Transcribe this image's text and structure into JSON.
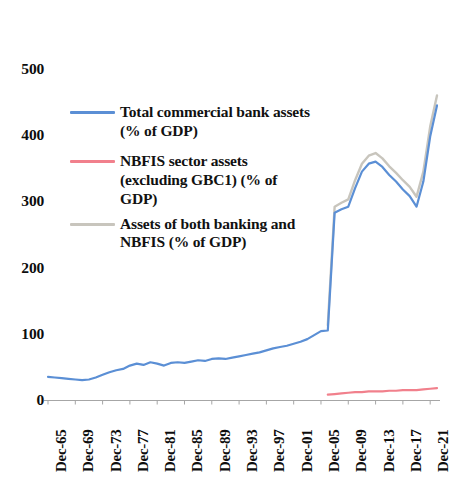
{
  "chart_data": {
    "type": "line",
    "title": "",
    "subtitle": "",
    "xlabel": "",
    "ylabel": "",
    "ylim": [
      0,
      500
    ],
    "y_ticks": [
      0,
      100,
      200,
      300,
      400,
      500
    ],
    "grid": false,
    "legend_position": "inside-upper-left",
    "x_tick_labels": [
      "Dec-65",
      "Dec-69",
      "Dec-73",
      "Dec-77",
      "Dec-81",
      "Dec-85",
      "Dec-89",
      "Dec-93",
      "Dec-97",
      "Dec-01",
      "Dec-05",
      "Dec-09",
      "Dec-13",
      "Dec-17",
      "Dec-21"
    ],
    "x_tick_years": [
      1965,
      1969,
      1973,
      1977,
      1981,
      1985,
      1989,
      1993,
      1997,
      2001,
      2005,
      2009,
      2013,
      2017,
      2021
    ],
    "x_range_years": [
      1965,
      2022
    ],
    "colors": {
      "series_bank": "#5B8FD5",
      "series_nbfis": "#F1808C",
      "series_both": "#C8C5BD",
      "axis": "#A6A6A6",
      "text": "#0d0d0d"
    },
    "series": [
      {
        "name": "Total commercial bank assets (% of GDP)",
        "color": "#5B8FD5",
        "x": [
          1965,
          1966,
          1967,
          1968,
          1969,
          1970,
          1971,
          1972,
          1973,
          1974,
          1975,
          1976,
          1977,
          1978,
          1979,
          1980,
          1981,
          1982,
          1983,
          1984,
          1985,
          1986,
          1987,
          1988,
          1989,
          1990,
          1991,
          1992,
          1993,
          1994,
          1995,
          1996,
          1997,
          1998,
          1999,
          2000,
          2001,
          2002,
          2003,
          2004,
          2005,
          2006,
          2007,
          2008,
          2009,
          2010,
          2011,
          2012,
          2013,
          2014,
          2015,
          2016,
          2017,
          2018,
          2019,
          2020,
          2021,
          2022
        ],
        "values": [
          35,
          34,
          33,
          32,
          31,
          30,
          31,
          34,
          38,
          42,
          45,
          47,
          52,
          55,
          53,
          57,
          55,
          52,
          56,
          57,
          56,
          58,
          60,
          59,
          62,
          63,
          62,
          64,
          66,
          68,
          70,
          72,
          75,
          78,
          80,
          82,
          85,
          88,
          92,
          98,
          104,
          105,
          283,
          288,
          292,
          320,
          345,
          357,
          360,
          352,
          340,
          330,
          318,
          308,
          292,
          330,
          398,
          445
        ]
      },
      {
        "name": "NBFIS sector assets (excluding GBC1) (% of GDP)",
        "color": "#F1808C",
        "x": [
          2006,
          2007,
          2008,
          2009,
          2010,
          2011,
          2012,
          2013,
          2014,
          2015,
          2016,
          2017,
          2018,
          2019,
          2020,
          2021,
          2022
        ],
        "values": [
          8,
          9,
          10,
          11,
          12,
          12,
          13,
          13,
          13,
          14,
          14,
          15,
          15,
          15,
          16,
          17,
          18
        ]
      },
      {
        "name": "Assets of both banking and NBFIS (% of GDP)",
        "color": "#C8C5BD",
        "x": [
          2006,
          2007,
          2008,
          2009,
          2010,
          2011,
          2012,
          2013,
          2014,
          2015,
          2016,
          2017,
          2018,
          2019,
          2020,
          2021,
          2022
        ],
        "values": [
          113,
          292,
          298,
          303,
          332,
          357,
          369,
          373,
          365,
          353,
          343,
          332,
          322,
          307,
          345,
          413,
          460
        ]
      }
    ]
  },
  "axis": {
    "y_labels": [
      "500",
      "400",
      "300",
      "200",
      "100",
      "0"
    ]
  },
  "legend": {
    "items": [
      {
        "id": "total-commercial-bank-assets",
        "label": "Total commercial bank assets (% of GDP)",
        "color": "#5B8FD5"
      },
      {
        "id": "nbfis-sector-assets",
        "label": "NBFIS sector assets (excluding GBC1) (% of GDP)",
        "color": "#F1808C"
      },
      {
        "id": "assets-of-both-banking-and-nbfis",
        "label": "Assets of both banking and NBFIS (% of GDP)",
        "color": "#C8C5BD"
      }
    ]
  }
}
